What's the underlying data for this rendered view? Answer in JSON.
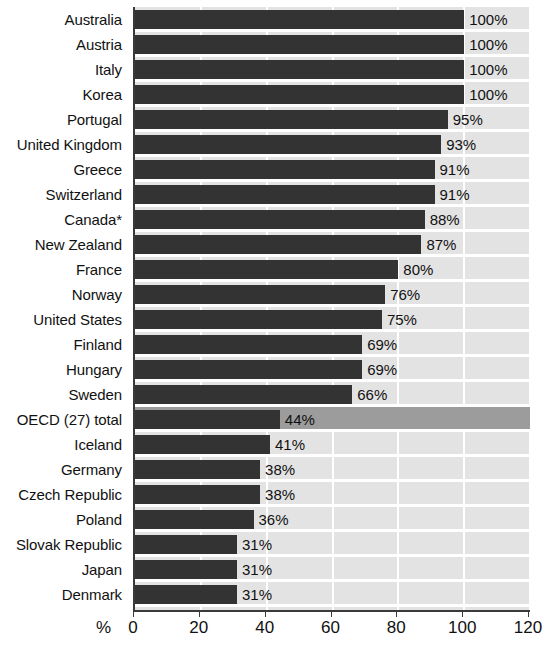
{
  "chart_data": {
    "type": "bar",
    "orientation": "horizontal",
    "title": "",
    "xlabel": "%",
    "ylabel": "",
    "xlim": [
      0,
      120
    ],
    "xticks": [
      0,
      20,
      40,
      60,
      80,
      100,
      120
    ],
    "grid": true,
    "legend": null,
    "value_label_suffix": "%",
    "highlight_category": "OECD (27) total",
    "categories": [
      "Australia",
      "Austria",
      "Italy",
      "Korea",
      "Portugal",
      "United Kingdom",
      "Greece",
      "Switzerland",
      "Canada*",
      "New Zealand",
      "France",
      "Norway",
      "United States",
      "Finland",
      "Hungary",
      "Sweden",
      "OECD (27) total",
      "Iceland",
      "Germany",
      "Czech Republic",
      "Poland",
      "Slovak Republic",
      "Japan",
      "Denmark"
    ],
    "values": [
      100,
      100,
      100,
      100,
      95,
      93,
      91,
      91,
      88,
      87,
      80,
      76,
      75,
      69,
      69,
      66,
      44,
      41,
      38,
      38,
      36,
      31,
      31,
      31
    ],
    "value_labels": [
      "100%",
      "100%",
      "100%",
      "100%",
      "95%",
      "93%",
      "91%",
      "91%",
      "88%",
      "87%",
      "80%",
      "76%",
      "75%",
      "69%",
      "69%",
      "66%",
      "44%",
      "41%",
      "38%",
      "38%",
      "36%",
      "31%",
      "31%",
      "31%"
    ],
    "colors": {
      "bar": "#333333",
      "plot_background": "#e3e3e3",
      "highlight_row": "#9c9c9c",
      "gridline": "#ffffff",
      "axis": "#3a3a3a",
      "text": "#111111"
    }
  }
}
